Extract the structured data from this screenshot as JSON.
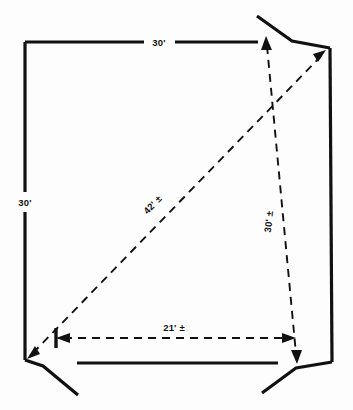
{
  "diagram": {
    "type": "survey-plan",
    "background_color": "#fdfdfd",
    "line_color": "#111111",
    "dimensions": {
      "top_edge": {
        "label": "30'",
        "name": "top-dimension-label"
      },
      "left_edge": {
        "label": "30'",
        "name": "left-dimension-label"
      },
      "diagonal": {
        "label": "42' ±",
        "name": "diagonal-dimension-label"
      },
      "right_interior": {
        "label": "30' ±",
        "name": "right-interior-dimension-label"
      },
      "bottom_offset": {
        "label": "21' ±",
        "name": "bottom-offset-dimension-label"
      }
    },
    "geometry": {
      "corner_top_left": [
        25,
        42
      ],
      "corner_top_right": [
        330,
        48
      ],
      "corner_bottom_left": [
        25,
        360
      ],
      "corner_bottom_right": [
        332,
        362
      ],
      "top_edge_break_start": 130,
      "top_edge_break_end": 160,
      "left_edge_break_start": 190,
      "left_edge_break_end": 212
    }
  }
}
